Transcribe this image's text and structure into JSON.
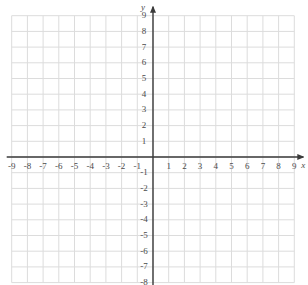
{
  "figure": {
    "kind": "cartesian-coordinate-grid",
    "title": "",
    "background_color": "#ffffff",
    "grid_color": "#dcdcdc",
    "axis_color": "#3a3a3a",
    "label_color": "#4a4a4a"
  },
  "axes": {
    "x": {
      "name": "x",
      "min": -9,
      "max": 9,
      "step": 1,
      "arrow": "right",
      "labels": [
        "-9",
        "-8",
        "-7",
        "-6",
        "-5",
        "-4",
        "-3",
        "-2",
        "-1",
        "1",
        "2",
        "3",
        "4",
        "5",
        "6",
        "7",
        "8",
        "9"
      ],
      "values": [
        -9,
        -8,
        -7,
        -6,
        -5,
        -4,
        -3,
        -2,
        -1,
        1,
        2,
        3,
        4,
        5,
        6,
        7,
        8,
        9
      ]
    },
    "y": {
      "name": "y",
      "min": -8,
      "max": 9,
      "step": 1,
      "arrow": "up",
      "labels": [
        "9",
        "8",
        "7",
        "6",
        "5",
        "4",
        "3",
        "2",
        "1",
        "-1",
        "-2",
        "-3",
        "-4",
        "-5",
        "-6",
        "-7",
        "-8"
      ],
      "values": [
        9,
        8,
        7,
        6,
        5,
        4,
        3,
        2,
        1,
        -1,
        -2,
        -3,
        -4,
        -5,
        -6,
        -7,
        -8
      ]
    }
  },
  "grid": {
    "visible": true,
    "x_lines": [
      -9,
      -8,
      -7,
      -6,
      -5,
      -4,
      -3,
      -2,
      -1,
      0,
      1,
      2,
      3,
      4,
      5,
      6,
      7,
      8,
      9
    ],
    "y_lines": [
      9,
      8,
      7,
      6,
      5,
      4,
      3,
      2,
      1,
      0,
      -1,
      -2,
      -3,
      -4,
      -5,
      -6,
      -7,
      -8
    ]
  },
  "geometry": {
    "origin_x": 153,
    "origin_y": 157,
    "cell": 15.7
  },
  "plotted": {
    "points": [],
    "lines": [],
    "curves": []
  }
}
